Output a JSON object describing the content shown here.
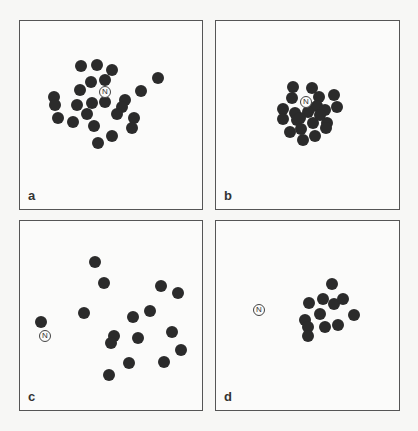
{
  "figure": {
    "nest_symbol": "N",
    "panels": [
      {
        "id": "a",
        "label": "a",
        "box": {
          "left": 19,
          "top": 20,
          "width": 184,
          "height": 190
        },
        "nest": {
          "x": 105,
          "y": 92
        },
        "dots": [
          [
            81,
            66
          ],
          [
            97,
            65
          ],
          [
            112,
            70
          ],
          [
            158,
            78
          ],
          [
            91,
            82
          ],
          [
            105,
            80
          ],
          [
            80,
            90
          ],
          [
            141,
            91
          ],
          [
            54,
            97
          ],
          [
            55,
            105
          ],
          [
            77,
            105
          ],
          [
            92,
            103
          ],
          [
            105,
            102
          ],
          [
            125,
            100
          ],
          [
            122,
            107
          ],
          [
            117,
            114
          ],
          [
            58,
            118
          ],
          [
            73,
            122
          ],
          [
            87,
            114
          ],
          [
            134,
            118
          ],
          [
            132,
            128
          ],
          [
            94,
            126
          ],
          [
            112,
            136
          ],
          [
            98,
            143
          ]
        ]
      },
      {
        "id": "b",
        "label": "b",
        "box": {
          "left": 215,
          "top": 20,
          "width": 185,
          "height": 190
        },
        "nest": {
          "x": 306,
          "y": 102
        },
        "dots": [
          [
            293,
            87
          ],
          [
            312,
            88
          ],
          [
            292,
            98
          ],
          [
            319,
            97
          ],
          [
            334,
            95
          ],
          [
            283,
            109
          ],
          [
            283,
            119
          ],
          [
            295,
            113
          ],
          [
            310,
            108
          ],
          [
            317,
            106
          ],
          [
            325,
            110
          ],
          [
            337,
            107
          ],
          [
            297,
            120
          ],
          [
            313,
            123
          ],
          [
            327,
            123
          ],
          [
            326,
            128
          ],
          [
            290,
            132
          ],
          [
            301,
            129
          ],
          [
            303,
            140
          ],
          [
            315,
            136
          ],
          [
            308,
            112
          ],
          [
            320,
            115
          ],
          [
            300,
            118
          ]
        ]
      },
      {
        "id": "c",
        "label": "c",
        "box": {
          "left": 19,
          "top": 220,
          "width": 184,
          "height": 191
        },
        "nest": {
          "x": 45,
          "y": 336
        },
        "dots": [
          [
            95,
            262
          ],
          [
            104,
            283
          ],
          [
            161,
            286
          ],
          [
            178,
            293
          ],
          [
            84,
            313
          ],
          [
            41,
            322
          ],
          [
            133,
            317
          ],
          [
            150,
            311
          ],
          [
            114,
            336
          ],
          [
            111,
            343
          ],
          [
            138,
            338
          ],
          [
            172,
            332
          ],
          [
            181,
            350
          ],
          [
            129,
            363
          ],
          [
            164,
            362
          ],
          [
            109,
            375
          ]
        ]
      },
      {
        "id": "d",
        "label": "d",
        "box": {
          "left": 215,
          "top": 220,
          "width": 185,
          "height": 191
        },
        "nest": {
          "x": 259,
          "y": 310
        },
        "dots": [
          [
            332,
            284
          ],
          [
            309,
            303
          ],
          [
            323,
            299
          ],
          [
            334,
            304
          ],
          [
            343,
            299
          ],
          [
            320,
            314
          ],
          [
            354,
            315
          ],
          [
            305,
            320
          ],
          [
            308,
            327
          ],
          [
            325,
            327
          ],
          [
            338,
            325
          ],
          [
            308,
            336
          ]
        ]
      }
    ],
    "colors": {
      "dot": "#2b2b2b",
      "border": "#555555",
      "background": "#fbfbfa"
    }
  }
}
